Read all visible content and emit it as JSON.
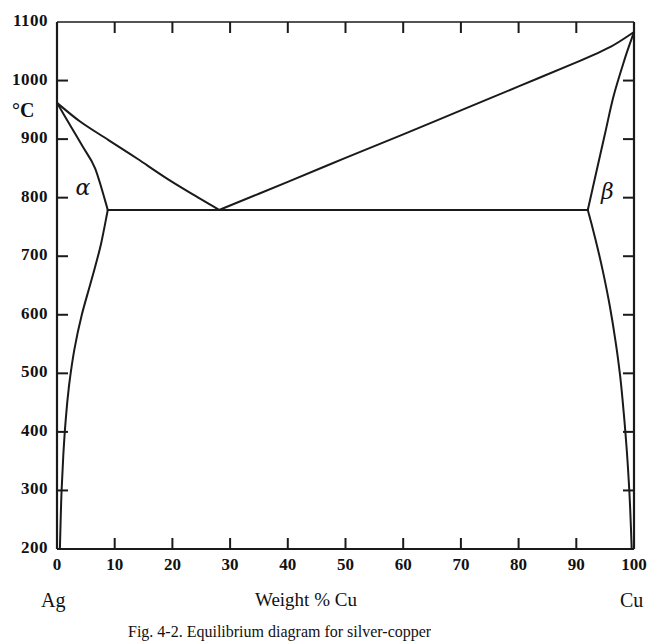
{
  "figure": {
    "axis_title": "Weight % Cu",
    "left_end_label": "Ag",
    "right_end_label": "Cu",
    "y_axis_unit": "°C",
    "caption": "Fig. 4-2.   Equilibrium diagram for silver-copper",
    "region_labels": {
      "alpha": "α",
      "beta": "β"
    },
    "ink_color": "#1a1a1a"
  },
  "chart_data": {
    "type": "line",
    "title": "",
    "subtitle": "",
    "xlabel": "Weight % Cu",
    "ylabel": "°C",
    "xlim": [
      0,
      100
    ],
    "ylim": [
      200,
      1100
    ],
    "grid": false,
    "legend": null,
    "x_ticks": [
      0,
      10,
      20,
      30,
      40,
      50,
      60,
      70,
      80,
      90,
      100
    ],
    "x_tick_labels": [
      "0",
      "10",
      "20",
      "30",
      "40",
      "50",
      "60",
      "70",
      "80",
      "90",
      "100"
    ],
    "y_ticks": [
      200,
      300,
      400,
      500,
      600,
      700,
      800,
      900,
      1000,
      1100
    ],
    "y_tick_labels": [
      "200",
      "300",
      "400",
      "500",
      "600",
      "700",
      "800",
      "900",
      "1000",
      "1100"
    ],
    "annotations": [
      {
        "text": "α",
        "x": 5.0,
        "y": 805
      },
      {
        "text": "β",
        "x": 95.0,
        "y": 800
      },
      {
        "text": "Ag",
        "x": 0,
        "y": 150
      },
      {
        "text": "Cu",
        "x": 100,
        "y": 150
      }
    ],
    "key_points": {
      "melting_point_Ag": {
        "x": 0,
        "y": 962
      },
      "melting_point_Cu": {
        "x": 100,
        "y": 1083
      },
      "eutectic": {
        "x": 28.1,
        "y": 779
      },
      "alpha_max_solubility": {
        "x": 8.8,
        "y": 779
      },
      "beta_max_solubility": {
        "x": 92.0,
        "y": 779
      }
    },
    "series": [
      {
        "name": "Liquidus (Ag-rich)",
        "points": [
          [
            0,
            962
          ],
          [
            4,
            930
          ],
          [
            9,
            898
          ],
          [
            14,
            866
          ],
          [
            19,
            833
          ],
          [
            24,
            803
          ],
          [
            28.1,
            779
          ]
        ]
      },
      {
        "name": "Liquidus (Cu-rich)",
        "points": [
          [
            28.1,
            779
          ],
          [
            40,
            827
          ],
          [
            50,
            868
          ],
          [
            60,
            908
          ],
          [
            70,
            949
          ],
          [
            80,
            990
          ],
          [
            90,
            1031
          ],
          [
            96,
            1058
          ],
          [
            100,
            1083
          ]
        ]
      },
      {
        "name": "Solidus (alpha)",
        "points": [
          [
            0,
            962
          ],
          [
            2.2,
            925
          ],
          [
            4.4,
            888
          ],
          [
            6.6,
            850
          ],
          [
            8.8,
            779
          ]
        ]
      },
      {
        "name": "Solidus (beta)",
        "points": [
          [
            100,
            1083
          ],
          [
            98.5,
            1040
          ],
          [
            96.5,
            975
          ],
          [
            95,
            910
          ],
          [
            93.5,
            845
          ],
          [
            92,
            779
          ]
        ]
      },
      {
        "name": "Eutectic horizontal",
        "points": [
          [
            8.8,
            779
          ],
          [
            28.1,
            779
          ],
          [
            92,
            779
          ]
        ]
      },
      {
        "name": "Solvus (alpha)",
        "points": [
          [
            8.8,
            779
          ],
          [
            7.6,
            720
          ],
          [
            6.0,
            660
          ],
          [
            4.3,
            600
          ],
          [
            3.0,
            540
          ],
          [
            2.1,
            480
          ],
          [
            1.5,
            420
          ],
          [
            1.1,
            360
          ],
          [
            0.8,
            300
          ],
          [
            0.6,
            240
          ],
          [
            0.5,
            200
          ]
        ]
      },
      {
        "name": "Solvus (beta)",
        "points": [
          [
            92,
            779
          ],
          [
            93.3,
            730
          ],
          [
            94.6,
            675
          ],
          [
            95.8,
            615
          ],
          [
            96.8,
            555
          ],
          [
            97.6,
            495
          ],
          [
            98.2,
            435
          ],
          [
            98.7,
            375
          ],
          [
            99.1,
            315
          ],
          [
            99.4,
            255
          ],
          [
            99.6,
            200
          ]
        ]
      }
    ]
  }
}
